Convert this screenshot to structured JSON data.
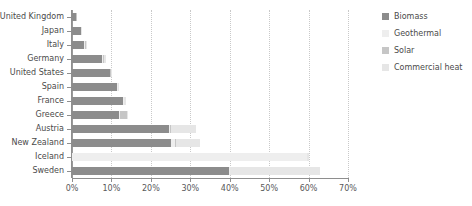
{
  "chart_data": {
    "type": "bar",
    "orientation": "horizontal",
    "stacked": true,
    "title": "",
    "subtitle": "",
    "xlabel": "",
    "ylabel": "",
    "xlim": [
      0,
      70
    ],
    "xtick_values": [
      0,
      10,
      20,
      30,
      40,
      50,
      60,
      70
    ],
    "xtick_labels": [
      "0%",
      "10%",
      "20%",
      "30%",
      "40%",
      "50%",
      "60%",
      "70%"
    ],
    "grid": true,
    "grid_axis": "x",
    "legend_position": "right",
    "categories": [
      "United Kingdom",
      "Japan",
      "Italy",
      "Germany",
      "United States",
      "Spain",
      "France",
      "Greece",
      "Austria",
      "New Zealand",
      "Iceland",
      "Sweden"
    ],
    "series": [
      {
        "name": "Biomass",
        "color": "#8c8c8c",
        "values": [
          1.0,
          2.3,
          3.0,
          7.6,
          9.6,
          11.5,
          13.0,
          12.0,
          24.5,
          25.0,
          0.0,
          39.8
        ]
      },
      {
        "name": "Geothermal",
        "color": "#eeeeee",
        "values": [
          0.0,
          0.0,
          0.3,
          0.2,
          0.1,
          0.1,
          0.1,
          0.2,
          0.3,
          1.2,
          59.5,
          0.2
        ]
      },
      {
        "name": "Solar",
        "color": "#c6c6c6",
        "values": [
          0.1,
          0.1,
          0.2,
          0.3,
          0.1,
          0.1,
          0.2,
          1.7,
          0.4,
          0.2,
          0.2,
          0.2
        ]
      },
      {
        "name": "Commercial heat",
        "color": "#e6e6e6",
        "values": [
          0.0,
          0.1,
          0.2,
          0.5,
          0.2,
          0.1,
          0.4,
          0.4,
          6.3,
          6.1,
          0.3,
          22.8
        ]
      }
    ]
  },
  "legend": {
    "items": [
      {
        "label": "Biomass",
        "color": "#8c8c8c"
      },
      {
        "label": "Geothermal",
        "color": "#eeeeee"
      },
      {
        "label": "Solar",
        "color": "#c6c6c6"
      },
      {
        "label": "Commercial heat",
        "color": "#e6e6e6"
      }
    ]
  },
  "axis": {
    "x_ticks": [
      "0%",
      "10%",
      "20%",
      "30%",
      "40%",
      "50%",
      "60%",
      "70%"
    ]
  }
}
